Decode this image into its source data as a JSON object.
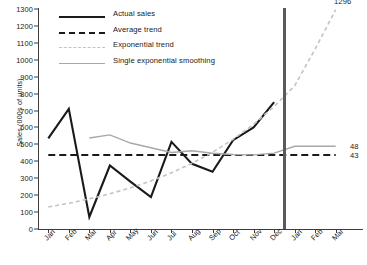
{
  "chart_data": {
    "type": "line",
    "title": "",
    "xlabel": "",
    "ylabel": "Sales (000s of units)",
    "ylim": [
      0,
      1300
    ],
    "ytick_step": 100,
    "yticks": [
      0,
      100,
      200,
      300,
      400,
      500,
      600,
      700,
      800,
      900,
      1000,
      1100,
      1200,
      1300
    ],
    "grid": false,
    "legend_position": "top-left",
    "categories": [
      "Jan",
      "Feb",
      "Mar",
      "Apr",
      "May",
      "Jun",
      "Jul",
      "Aug",
      "Sep",
      "Oct",
      "Nov",
      "Dec",
      "Jan",
      "Feb",
      "Mar"
    ],
    "forecast_divider_after": "Dec",
    "series": [
      {
        "name": "Actual sales",
        "style": "solid",
        "color": "#1a1a1a",
        "width": 2.1,
        "values": [
          535,
          710,
          71,
          375,
          280,
          188,
          515,
          385,
          338,
          525,
          600,
          750,
          null,
          null,
          null
        ]
      },
      {
        "name": "Average trend",
        "style": "dashed",
        "color": "#1a1a1a",
        "width": 2.1,
        "values": [
          437,
          437,
          437,
          437,
          437,
          437,
          437,
          437,
          437,
          437,
          437,
          437,
          437,
          437,
          437
        ]
      },
      {
        "name": "Exponential trend",
        "style": "dashed",
        "color": "#c3c3c3",
        "width": 1.6,
        "values": [
          130,
          152,
          178,
          208,
          243,
          284,
          332,
          388,
          453,
          530,
          619,
          724,
          846,
          1064,
          1296
        ]
      },
      {
        "name": "Single exponential smoothing",
        "style": "solid",
        "color": "#a8a8a8",
        "width": 1.4,
        "values": [
          null,
          null,
          538,
          556,
          508,
          480,
          452,
          462,
          448,
          440,
          438,
          448,
          489,
          489,
          489
        ]
      }
    ],
    "annotations": [
      {
        "name": "exponential-trend-endpoint",
        "text": "1296",
        "value": 1296,
        "x": "Mar"
      },
      {
        "name": "smoothing-endpoint",
        "text": "48",
        "value": 489,
        "x": "Mar"
      },
      {
        "name": "average-trend-endpoint",
        "text": "43",
        "value": 437,
        "x": "Mar"
      }
    ]
  },
  "legend": {
    "items": [
      {
        "label": "Actual sales"
      },
      {
        "label": "Average trend"
      },
      {
        "label": "Exponential trend"
      },
      {
        "label": "Single exponential smoothing"
      }
    ]
  }
}
